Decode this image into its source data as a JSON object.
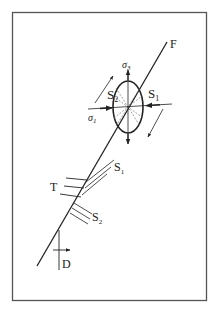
{
  "diagram": {
    "fault_label": "F",
    "sigma3": {
      "base": "σ",
      "sub": "3"
    },
    "sigma1": {
      "base": "σ",
      "sub": "1"
    },
    "s1_upper": {
      "base": "S",
      "sub": "1"
    },
    "s2_upper": {
      "base": "S",
      "sub": "2"
    },
    "s1_lower": {
      "base": "S",
      "sub": "1"
    },
    "s2_lower": {
      "base": "S",
      "sub": "2"
    },
    "t_label": "T",
    "d_label": "D",
    "colors": {
      "line": "#222222",
      "frame": "#555555",
      "dashed": "#777777"
    }
  }
}
